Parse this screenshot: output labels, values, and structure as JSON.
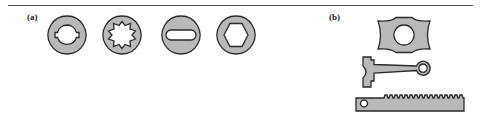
{
  "figure": {
    "panels": [
      {
        "label": "(a)",
        "description": "Hub cross-sections with shaft-engagement features"
      },
      {
        "label": "(b)",
        "description": "Mechanical parts: cam, connecting rod, gear rack"
      }
    ],
    "panel_a_parts": [
      {
        "name": "keyed-bore-ring",
        "feature": "circular bore with two keyways"
      },
      {
        "name": "spline-bore-ring",
        "feature": "six-tooth splined bore"
      },
      {
        "name": "slot-bore-disc",
        "feature": "oblong slot bore"
      },
      {
        "name": "hex-bore-ring",
        "feature": "hexagonal bore"
      }
    ],
    "panel_b_parts": [
      {
        "name": "cam",
        "feature": "bow-tie cam with circular bore"
      },
      {
        "name": "connecting-rod",
        "feature": "forked end and ring end"
      },
      {
        "name": "gear-rack",
        "feature": "toothed bar with hole at end"
      }
    ],
    "colors": {
      "fill": "#b9b9b9",
      "stroke": "#2a2a2a",
      "background": "#ffffff"
    }
  }
}
